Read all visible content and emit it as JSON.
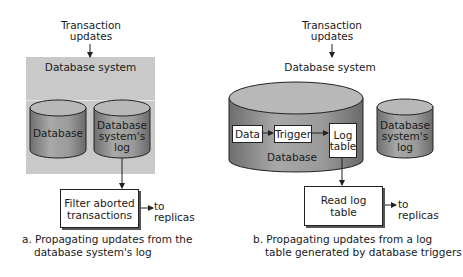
{
  "panel_a": {
    "input_label_line1": "Transaction",
    "input_label_line2": "updates",
    "system_label": "Database system",
    "database_cylinder": "Database",
    "log_cylinder_line1": "Database",
    "log_cylinder_line2": "system's",
    "log_cylinder_line3": "log",
    "process_box_line1": "Filter aborted",
    "process_box_line2": "transactions",
    "output_line1": "to",
    "output_line2": "replicas",
    "caption_line1": "a. Propagating updates from the",
    "caption_line2": "database system's log"
  },
  "panel_b": {
    "input_label_line1": "Transaction",
    "input_label_line2": "updates",
    "system_label": "Database system",
    "database_cylinder": "Database",
    "data_box": "Data",
    "trigger_box": "Trigger",
    "log_table_line1": "Log",
    "log_table_line2": "table",
    "log_cylinder_line1": "Database",
    "log_cylinder_line2": "system's",
    "log_cylinder_line3": "log",
    "process_box_line1": "Read log",
    "process_box_line2": "table",
    "output_line1": "to",
    "output_line2": "replicas",
    "caption_line1": "b. Propagating updates from a log",
    "caption_line2": "table generated by database triggers"
  },
  "colors": {
    "panel": "#c9c9c9",
    "cylinder_body": "#8f8f8f",
    "cylinder_top": "#b5b5b5",
    "stroke": "#222222"
  }
}
